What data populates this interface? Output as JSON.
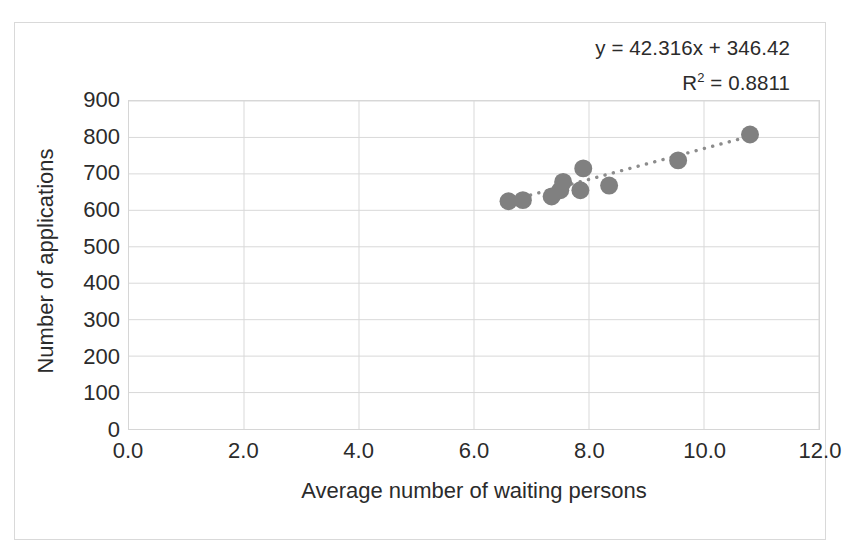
{
  "chart_data": {
    "type": "scatter",
    "title": "",
    "xlabel": "Average number of waiting persons",
    "ylabel": "Number of applications",
    "xlim": [
      0.0,
      12.0
    ],
    "ylim": [
      0,
      900
    ],
    "xticks": [
      "0.0",
      "2.0",
      "4.0",
      "6.0",
      "8.0",
      "10.0",
      "12.0"
    ],
    "xtick_values": [
      0,
      2,
      4,
      6,
      8,
      10,
      12
    ],
    "yticks": [
      "0",
      "100",
      "200",
      "300",
      "400",
      "500",
      "600",
      "700",
      "800",
      "900"
    ],
    "ytick_values": [
      0,
      100,
      200,
      300,
      400,
      500,
      600,
      700,
      800,
      900
    ],
    "grid": true,
    "legend": false,
    "marker_color": "#808080",
    "trendline_color": "#8c8c8c",
    "gridline_color": "#d9d9d9",
    "series": [
      {
        "name": "Applications vs waiting persons",
        "x": [
          6.6,
          6.85,
          7.35,
          7.5,
          7.55,
          7.85,
          7.9,
          8.35,
          9.55,
          10.8
        ],
        "y": [
          625,
          628,
          638,
          655,
          678,
          655,
          715,
          668,
          737,
          808
        ]
      }
    ],
    "trendline": {
      "equation": "y = 42.316x + 346.42",
      "r_squared_label": "R² = 0.8811",
      "r_squared_value": 0.8811,
      "slope": 42.316,
      "intercept": 346.42,
      "style": "dotted",
      "x_start": 6.55,
      "x_end": 10.95
    },
    "annotations": [
      "y = 42.316x + 346.42",
      "R² = 0.8811"
    ]
  }
}
